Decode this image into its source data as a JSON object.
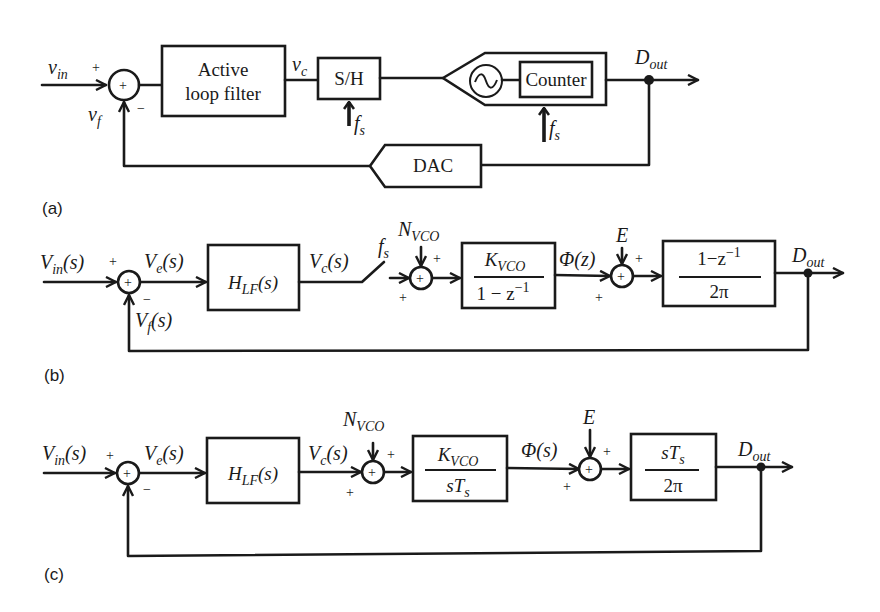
{
  "figure": {
    "panels": [
      {
        "id": "a",
        "label": "(a)",
        "signals": {
          "input": {
            "main": "v",
            "sub": "in"
          },
          "feedback": {
            "main": "v",
            "sub": "f"
          },
          "control": {
            "main": "v",
            "sub": "c"
          },
          "output": {
            "main": "D",
            "sub": "out"
          },
          "clock1": {
            "main": "f",
            "sub": "s"
          },
          "clock2": {
            "main": "f",
            "sub": "s"
          }
        },
        "summer": {
          "symbol": "+",
          "sign_in": "+",
          "sign_fb": "−"
        },
        "blocks": {
          "filter": {
            "line1": "Active",
            "line2": "loop filter"
          },
          "sample_hold": {
            "label": "S/H"
          },
          "counter": {
            "label": "Counter"
          },
          "oscillator": {
            "symbol": "~"
          },
          "dac": {
            "label": "DAC"
          }
        }
      },
      {
        "id": "b",
        "label": "(b)",
        "signals": {
          "input": {
            "main": "V",
            "sub": "in",
            "arg": "(s)"
          },
          "error": {
            "main": "V",
            "sub": "e",
            "arg": "(s)"
          },
          "feedback": {
            "main": "V",
            "sub": "f",
            "arg": "(s)"
          },
          "control": {
            "main": "V",
            "sub": "c",
            "arg": "(s)"
          },
          "switch_clock": {
            "main": "f",
            "sub": "s"
          },
          "noise": {
            "main": "N",
            "sub": "VCO"
          },
          "phase": {
            "text": "Φ(z)"
          },
          "quant": {
            "text": "E"
          },
          "output": {
            "main": "D",
            "sub": "out"
          }
        },
        "summers": [
          {
            "symbol": "+",
            "sign_in": "+",
            "sign_fb": "−"
          },
          {
            "symbol": "+",
            "sign_top": "+",
            "sign_in": "+"
          },
          {
            "symbol": "+",
            "sign_top": "+",
            "sign_in": "+"
          }
        ],
        "blocks": {
          "filter": {
            "main": "H",
            "sub": "LF",
            "arg": "(s)"
          },
          "vco": {
            "num_main": "K",
            "num_sub": "VCO",
            "den": "1 − z",
            "den_sup": "−1"
          },
          "diff": {
            "num": "1−z",
            "num_sup": "−1",
            "den": "2π"
          }
        }
      },
      {
        "id": "c",
        "label": "(c)",
        "signals": {
          "input": {
            "main": "V",
            "sub": "in",
            "arg": "(s)"
          },
          "error": {
            "main": "V",
            "sub": "e",
            "arg": "(s)"
          },
          "control": {
            "main": "V",
            "sub": "c",
            "arg": "(s)"
          },
          "noise": {
            "main": "N",
            "sub": "VCO"
          },
          "phase": {
            "text": "Φ(s)"
          },
          "quant": {
            "text": "E"
          },
          "output": {
            "main": "D",
            "sub": "out"
          }
        },
        "summers": [
          {
            "symbol": "+",
            "sign_in": "+",
            "sign_fb": "−"
          },
          {
            "symbol": "+",
            "sign_top": "+",
            "sign_in": "+"
          },
          {
            "symbol": "+",
            "sign_top": "+",
            "sign_in": "+"
          }
        ],
        "blocks": {
          "filter": {
            "main": "H",
            "sub": "LF",
            "arg": "(s)"
          },
          "vco": {
            "num_main": "K",
            "num_sub": "VCO",
            "den_main": "sT",
            "den_sub": "s"
          },
          "diff": {
            "num_main": "sT",
            "num_sub": "s",
            "den": "2π"
          }
        }
      }
    ]
  }
}
